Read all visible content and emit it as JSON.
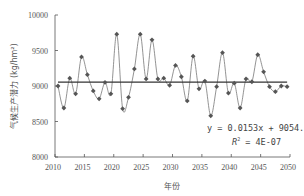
{
  "chart_data": {
    "type": "line",
    "title": "",
    "xlabel": "年份",
    "ylabel": "气候生产潜力 (kg/hm²)",
    "xlim": [
      2010,
      2050
    ],
    "ylim": [
      8000,
      10000
    ],
    "xticks": [
      2010,
      2015,
      2020,
      2025,
      2030,
      2035,
      2040,
      2045,
      2050
    ],
    "yticks": [
      8000,
      8500,
      9000,
      9500,
      10000
    ],
    "grid": false,
    "legend": null,
    "x": [
      2010,
      2011,
      2012,
      2013,
      2014,
      2015,
      2016,
      2017,
      2018,
      2019,
      2020,
      2021,
      2022,
      2023,
      2024,
      2025,
      2026,
      2027,
      2028,
      2029,
      2030,
      2031,
      2032,
      2033,
      2034,
      2035,
      2036,
      2037,
      2038,
      2039,
      2040,
      2041,
      2042,
      2043,
      2044,
      2045,
      2046,
      2047,
      2048,
      2049
    ],
    "series": [
      {
        "name": "气候生产潜力",
        "marker": "diamond",
        "smooth": true,
        "values": [
          9000,
          8690,
          9110,
          8890,
          9410,
          9160,
          8930,
          8820,
          9050,
          8890,
          9730,
          8680,
          8840,
          9240,
          9730,
          9100,
          9650,
          9100,
          9110,
          9010,
          9290,
          9130,
          8790,
          9420,
          8960,
          9070,
          8580,
          8990,
          9470,
          8900,
          9040,
          8690,
          9100,
          9060,
          9440,
          9200,
          8990,
          8920,
          9000,
          8990
        ]
      }
    ],
    "trendline": {
      "type": "linear",
      "slope": 0.0153,
      "intercept": 9054.3,
      "equation_label": "y = 0.0153x + 9054.3",
      "r2_label_prefix": "R",
      "r2_label_sup": "2",
      "r2_label_value": " = 4E-07"
    }
  },
  "colors": {
    "axis": "#555555",
    "line": "#777777",
    "marker": "#555555",
    "trend": "#333333"
  }
}
